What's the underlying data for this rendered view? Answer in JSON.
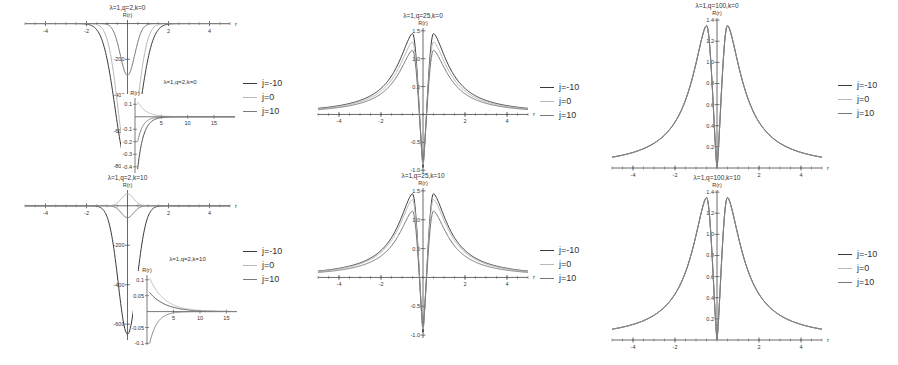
{
  "figure": {
    "legend": [
      "j=-10",
      "j=0",
      "j=10"
    ],
    "series_colors": [
      "#3a3a3a",
      "#b8b8b8",
      "#7a7a7a"
    ]
  },
  "chart_data": [
    {
      "type": "line",
      "title": "λ=1,q=2,k=0",
      "ylabel": "R(r)",
      "xlabel": "r",
      "xlim": [
        -5,
        5
      ],
      "ylim": [
        -820,
        20
      ],
      "xticks": [
        -4,
        -2,
        2,
        4
      ],
      "yticks": [
        -200,
        -400,
        -600,
        -800
      ],
      "series": [
        {
          "name": "j=-10",
          "peak_at_0": -790,
          "width": 0.6
        },
        {
          "name": "j=0",
          "peak_at_0": -760,
          "width": 0.48
        },
        {
          "name": "j=10",
          "peak_at_0": -290,
          "width": 0.35
        }
      ],
      "inset": {
        "title": "λ=1,q=2,k=0",
        "ylabel": "R(r)",
        "xlim": [
          0,
          19
        ],
        "ylim": [
          -0.45,
          0.15
        ],
        "xticks": [
          5,
          10,
          15
        ],
        "yticks": [
          0.1,
          -0.1,
          -0.2,
          -0.3,
          -0.4
        ],
        "series": [
          {
            "name": "j=-10",
            "start": -0.42,
            "decay": 1.1
          },
          {
            "name": "j=0",
            "start": 0.12,
            "decay": 1.6
          },
          {
            "name": "j=10",
            "start": -0.2,
            "decay": 1.0
          }
        ]
      },
      "legend_position": "right"
    },
    {
      "type": "line",
      "title": "λ=1,q=25,k=0",
      "ylabel": "R(r)",
      "xlabel": "r",
      "xlim": [
        -5,
        5
      ],
      "ylim": [
        -1.05,
        1.55
      ],
      "xticks": [
        -4,
        -2,
        2,
        4
      ],
      "yticks": [
        1.5,
        1.0,
        0.5,
        -0.5,
        -1.0
      ],
      "series": [
        {
          "name": "j=-10",
          "peak": 1.45,
          "peak_r": 0.5,
          "min_at_0": -0.95
        },
        {
          "name": "j=0",
          "peak": 1.3,
          "peak_r": 0.5,
          "min_at_0": -0.9
        },
        {
          "name": "j=10",
          "peak": 1.15,
          "peak_r": 0.5,
          "min_at_0": -0.85
        }
      ],
      "legend_position": "right"
    },
    {
      "type": "line",
      "title": "λ=1,q=100,k=0",
      "ylabel": "R(r)",
      "xlabel": "r",
      "xlim": [
        -5,
        5
      ],
      "ylim": [
        0,
        1.42
      ],
      "xticks": [
        -4,
        -2,
        2,
        4
      ],
      "yticks": [
        0.2,
        0.4,
        0.6,
        0.8,
        1.0,
        1.2,
        1.4
      ],
      "series": [
        {
          "name": "j=-10",
          "peak": 1.35,
          "peak_r": 0.5,
          "min_at_0": 0.0
        },
        {
          "name": "j=0",
          "peak": 1.35,
          "peak_r": 0.5,
          "min_at_0": 0.0
        },
        {
          "name": "j=10",
          "peak": 1.35,
          "peak_r": 0.5,
          "min_at_0": 0.0
        }
      ],
      "legend_position": "right"
    },
    {
      "type": "line",
      "title": "λ=1,q=2,k=10",
      "ylabel": "R(r)",
      "xlabel": "r",
      "xlim": [
        -5,
        5
      ],
      "ylim": [
        -680,
        80
      ],
      "xticks": [
        -4,
        -2,
        2,
        4
      ],
      "yticks": [
        -200,
        -400,
        -600
      ],
      "series": [
        {
          "name": "j=-10",
          "peak_at_0": -650,
          "width": 0.45
        },
        {
          "name": "j=0",
          "peak_at_0": 60,
          "width": 0.3
        },
        {
          "name": "j=10",
          "peak_at_0": -60,
          "width": 0.3
        }
      ],
      "inset": {
        "title": "λ=1,q=2,k=10",
        "ylabel": "R(r)",
        "xlim": [
          0,
          17
        ],
        "ylim": [
          -0.105,
          0.115
        ],
        "xticks": [
          5,
          10,
          15
        ],
        "yticks": [
          0.1,
          0.05,
          -0.05,
          -0.1
        ],
        "series": [
          {
            "name": "j=-10",
            "start": 0.06,
            "decay": 3.0
          },
          {
            "name": "j=0",
            "start": 0.105,
            "decay": 2.8
          },
          {
            "name": "j=10",
            "start": -0.1,
            "decay": 1.4
          }
        ]
      },
      "legend_position": "right"
    },
    {
      "type": "line",
      "title": "λ=1,q=25,k=10",
      "ylabel": "R(r)",
      "xlabel": "r",
      "xlim": [
        -5,
        5
      ],
      "ylim": [
        -1.05,
        1.55
      ],
      "xticks": [
        -4,
        -2,
        2,
        4
      ],
      "yticks": [
        1.5,
        1.0,
        0.5,
        -0.5,
        -1.0
      ],
      "series": [
        {
          "name": "j=-10",
          "peak": 1.45,
          "peak_r": 0.5,
          "min_at_0": -0.95
        },
        {
          "name": "j=0",
          "peak": 1.35,
          "peak_r": 0.5,
          "min_at_0": -0.9
        },
        {
          "name": "j=10",
          "peak": 1.15,
          "peak_r": 0.5,
          "min_at_0": -0.85
        }
      ],
      "legend_position": "right"
    },
    {
      "type": "line",
      "title": "λ=1,q=100,k=10",
      "ylabel": "R(r)",
      "xlabel": "r",
      "xlim": [
        -5,
        5
      ],
      "ylim": [
        0,
        1.42
      ],
      "xticks": [
        -4,
        -2,
        2,
        4
      ],
      "yticks": [
        0.2,
        0.4,
        0.6,
        0.8,
        1.0,
        1.2,
        1.4
      ],
      "series": [
        {
          "name": "j=-10",
          "peak": 1.35,
          "peak_r": 0.5,
          "min_at_0": 0.0
        },
        {
          "name": "j=0",
          "peak": 1.35,
          "peak_r": 0.5,
          "min_at_0": 0.0
        },
        {
          "name": "j=10",
          "peak": 1.35,
          "peak_r": 0.5,
          "min_at_0": 0.0
        }
      ],
      "legend_position": "right"
    }
  ],
  "layout": {
    "panels": [
      {
        "x": 25,
        "y": 20,
        "w": 205,
        "h": 150,
        "legend_x": 243,
        "legend_y": 76,
        "inset": {
          "x": 135,
          "y": 98,
          "w": 100,
          "h": 75
        }
      },
      {
        "x": 318,
        "y": 28,
        "w": 210,
        "h": 145,
        "legend_x": 540,
        "legend_y": 80
      },
      {
        "x": 612,
        "y": 18,
        "w": 210,
        "h": 150,
        "legend_x": 838,
        "legend_y": 78
      },
      {
        "x": 25,
        "y": 190,
        "w": 205,
        "h": 150,
        "legend_x": 243,
        "legend_y": 244,
        "inset": {
          "x": 147,
          "y": 275,
          "w": 90,
          "h": 70
        }
      },
      {
        "x": 318,
        "y": 188,
        "w": 210,
        "h": 150,
        "legend_x": 540,
        "legend_y": 243
      },
      {
        "x": 612,
        "y": 190,
        "w": 210,
        "h": 150,
        "legend_x": 838,
        "legend_y": 247
      }
    ]
  }
}
